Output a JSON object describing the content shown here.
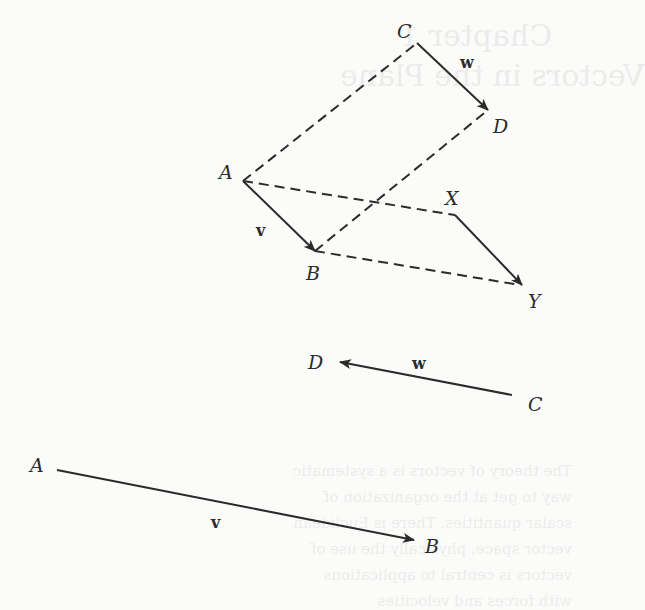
{
  "figure": {
    "top_diagram": {
      "points": {
        "A": {
          "label": "A",
          "x": 243,
          "y": 181
        },
        "B": {
          "label": "B",
          "x": 315,
          "y": 251
        },
        "C": {
          "label": "C",
          "x": 417,
          "y": 43
        },
        "D": {
          "label": "D",
          "x": 488,
          "y": 110
        },
        "X": {
          "label": "X",
          "x": 455,
          "y": 215
        },
        "Y": {
          "label": "Y",
          "x": 522,
          "y": 285
        }
      },
      "solid_vectors": [
        {
          "from": "A",
          "to": "B",
          "label": "v"
        },
        {
          "from": "C",
          "to": "D",
          "label": "w"
        },
        {
          "from": "X",
          "to": "Y",
          "label": ""
        }
      ],
      "dashed_segments": [
        {
          "from": "A",
          "to": "C"
        },
        {
          "from": "B",
          "to": "D"
        },
        {
          "from": "A",
          "to": "X"
        },
        {
          "from": "B",
          "to": "Y"
        }
      ]
    },
    "middle_vector": {
      "from_label": "C",
      "to_label": "D",
      "vector_label": "w"
    },
    "bottom_vector": {
      "from_label": "A",
      "to_label": "B",
      "vector_label": "v"
    }
  },
  "colors": {
    "ink": "#2b2b2b",
    "background": "#fbfbfa"
  },
  "bleed_through": {
    "title": "Chapter 1",
    "subtitle": "Vectors in the Plane",
    "paragraph": "The theory of vectors is a systematic way to get at the organization of scalar quantities. There is Euclidean vector space, physically the use of vectors is central to applications with forces and velocities"
  }
}
